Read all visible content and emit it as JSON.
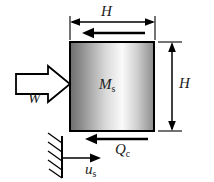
{
  "figure": {
    "background_color": "#ffffff",
    "line_color": "#000000",
    "text_color": "#1a1a1a"
  },
  "block": {
    "name": "mass-block",
    "label": "M",
    "label_subscript": "s",
    "border_color": "#000000",
    "fill_gradient": [
      {
        "stop": "0%",
        "color": "#6e6e6e"
      },
      {
        "stop": "12%",
        "color": "#8a8a8a"
      },
      {
        "stop": "42%",
        "color": "#d8d8d8"
      },
      {
        "stop": "62%",
        "color": "#fafafa"
      },
      {
        "stop": "80%",
        "color": "#cfcfcf"
      },
      {
        "stop": "100%",
        "color": "#8c8c8c"
      }
    ],
    "x": 70,
    "y": 42,
    "width": 84,
    "height": 89
  },
  "dimensions": {
    "top": {
      "name": "width-dimension",
      "label": "H",
      "orientation": "horizontal",
      "from_x": 70,
      "to_x": 155,
      "y": 22
    },
    "right": {
      "name": "height-dimension",
      "label": "H",
      "orientation": "vertical",
      "from_y": 42,
      "to_y": 131,
      "x": 172
    }
  },
  "arrows": [
    {
      "name": "load-arrow-W",
      "label": "W",
      "style": "hollow-block",
      "direction": "right",
      "tail_x": 16,
      "tip_x": 70,
      "y": 84
    },
    {
      "name": "top-reaction-arrow",
      "label": "",
      "style": "solid-line",
      "direction": "left",
      "tail_x": 145,
      "tip_x": 82,
      "y": 33
    },
    {
      "name": "cutting-force-arrow-Qc",
      "label": "Q",
      "label_subscript": "c",
      "style": "solid-line",
      "direction": "left",
      "tail_x": 148,
      "tip_x": 85,
      "y": 139
    },
    {
      "name": "displacement-arrow-us",
      "label": "u",
      "label_subscript": "s",
      "style": "solid-line",
      "direction": "right",
      "tail_x": 62,
      "tip_x": 101,
      "y": 158
    }
  ],
  "support": {
    "name": "fixed-wall-support",
    "wall_x": 62,
    "wall_top_y": 136,
    "wall_bottom_y": 178,
    "hatch_count": 5,
    "hatch_length": 14,
    "line_color": "#000000"
  },
  "labels": {
    "H_top": "H",
    "H_right": "H",
    "W": "W",
    "Ms_base": "M",
    "Ms_sub": "s",
    "Qc_base": "Q",
    "Qc_sub": "c",
    "us_base": "u",
    "us_sub": "s"
  }
}
